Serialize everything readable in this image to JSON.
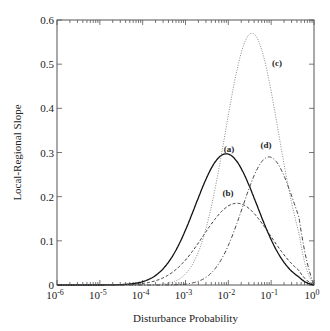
{
  "chart_data": {
    "type": "line",
    "title": "",
    "xlabel": "Disturbance Probability",
    "ylabel": "Local-Regional Slope",
    "xscale": "log",
    "xlim": [
      1e-06,
      1
    ],
    "ylim": [
      0,
      0.6
    ],
    "x_tick_labels": [
      "10-6",
      "10-5",
      "10-4",
      "10-3",
      "10-2",
      "10-1",
      "100"
    ],
    "y_tick_labels": [
      "0",
      "0.1",
      "0.2",
      "0.3",
      "0.4",
      "0.5",
      "0.6"
    ],
    "grid": false,
    "legend": "inline labels",
    "series": [
      {
        "name": "(a)",
        "style": "solid",
        "peak_x": 0.009,
        "peak_y": 0.297,
        "log_center": -2.05,
        "log_width": 0.72
      },
      {
        "name": "(b)",
        "style": "dashed",
        "peak_x": 0.016,
        "peak_y": 0.185,
        "log_center": -1.8,
        "log_width": 0.78
      },
      {
        "name": "(c)",
        "style": "dotted",
        "peak_x": 0.035,
        "peak_y": 0.57,
        "log_center": -1.45,
        "log_width": 0.62
      },
      {
        "name": "(d)",
        "style": "dash-dot",
        "peak_x": 0.09,
        "peak_y": 0.29,
        "log_center": -1.05,
        "log_width": 0.62
      }
    ]
  }
}
